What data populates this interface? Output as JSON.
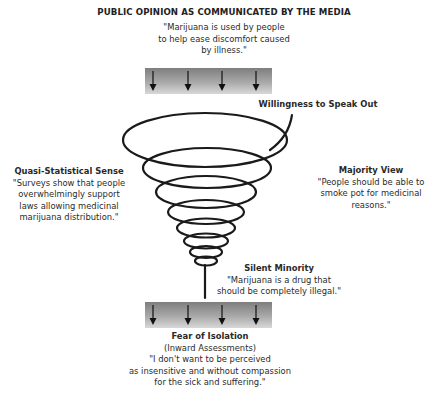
{
  "title": "PUBLIC OPINION AS COMMUNICATED BY THE MEDIA",
  "top_quote": {
    "lines": [
      "\"Marijuana is used by people",
      "to help ease discomfort caused",
      "by illness.\""
    ]
  },
  "top_bar": {
    "arrow_count": 4,
    "icon": "down-arrow-icon"
  },
  "willingness": {
    "heading": "Willingness to Speak Out"
  },
  "left": {
    "heading": "Quasi-Statistical Sense",
    "lines": [
      "\"Surveys show that people",
      "overwhelmingly support",
      "laws allowing medicinal",
      "marijuana distribution.\""
    ]
  },
  "right": {
    "heading": "Majority View",
    "lines": [
      "\"People should be able to",
      "smoke pot for medicinal",
      "reasons.\""
    ]
  },
  "silent": {
    "heading": "Silent Minority",
    "lines": [
      "\"Marijuana is a drug that",
      "should be completely illegal.\""
    ]
  },
  "bottom_bar": {
    "arrow_count": 4,
    "icon": "down-arrow-icon"
  },
  "bottom": {
    "heading": "Fear of Isolation",
    "subheading": "(Inward Assessments)",
    "lines": [
      "\"I don't want to be perceived",
      "as insensitive and without compassion",
      "for the sick and suffering.\""
    ]
  },
  "colors": {
    "spiral": "#1a1a1a",
    "bar_dark": "#7e7e7e",
    "bar_light": "#d8d8d8",
    "text": "#2a2a2a"
  }
}
